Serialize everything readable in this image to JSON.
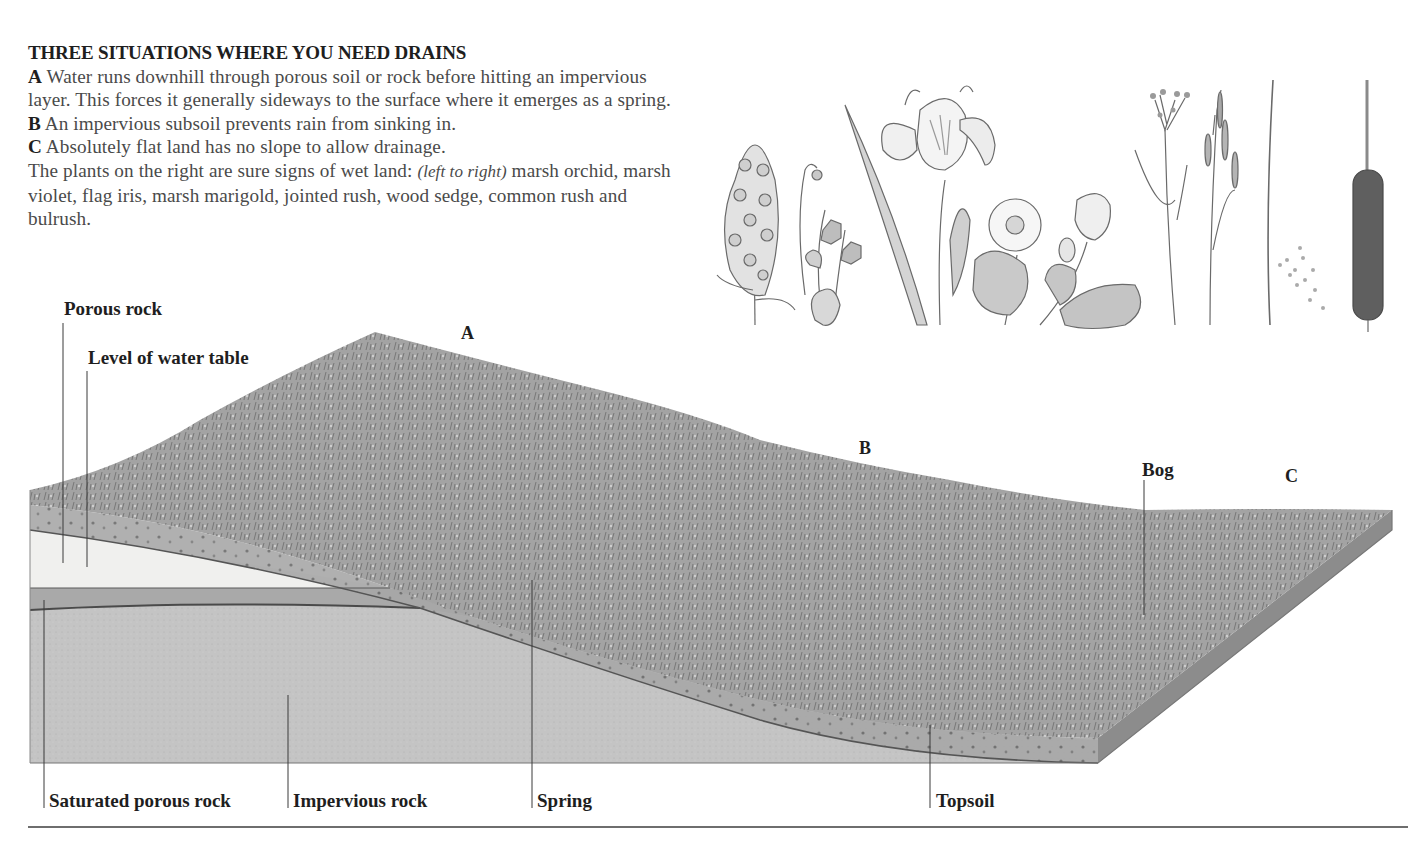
{
  "caption": {
    "heading": "THREE SITUATIONS WHERE YOU NEED DRAINS",
    "items": [
      {
        "key": "A",
        "text": "Water runs downhill through porous soil or rock before hitting an impervious layer. This forces it generally sideways to the surface where it emerges as a spring."
      },
      {
        "key": "B",
        "text": "An impervious subsoil prevents rain from sinking in."
      },
      {
        "key": "C",
        "text": "Absolutely flat land has no slope to allow drainage."
      }
    ],
    "plants_note": {
      "before": "The plants on the right are sure signs of wet land: ",
      "italic": "(left to right)",
      "after": " marsh orchid, marsh violet, flag iris, marsh marigold, jointed rush, wood sedge, common rush and bulrush."
    }
  },
  "plants": [
    {
      "name": "marsh orchid",
      "icon": "marsh-orchid-illustration"
    },
    {
      "name": "marsh violet",
      "icon": "marsh-violet-illustration"
    },
    {
      "name": "flag iris",
      "icon": "flag-iris-illustration"
    },
    {
      "name": "marsh marigold",
      "icon": "marsh-marigold-illustration"
    },
    {
      "name": "jointed rush",
      "icon": "jointed-rush-illustration"
    },
    {
      "name": "wood sedge",
      "icon": "wood-sedge-illustration"
    },
    {
      "name": "common rush",
      "icon": "common-rush-illustration"
    },
    {
      "name": "bulrush",
      "icon": "bulrush-illustration"
    }
  ],
  "diagram": {
    "situation_letters": {
      "a": "A",
      "b": "B",
      "c": "C"
    },
    "labels": {
      "porous_rock": "Porous rock",
      "water_table": "Level of water table",
      "bog": "Bog",
      "saturated_porous_rock": "Saturated porous rock",
      "impervious_rock": "Impervious rock",
      "spring": "Spring",
      "topsoil": "Topsoil"
    },
    "colors": {
      "vegetation": "#9a9a9a",
      "vegetation_dark": "#6f6f6f",
      "porous_rock": "#f0f0ee",
      "saturated_rock": "#a9a9a9",
      "impervious_rock": "#c4c4c4",
      "topsoil": "#a2a2a2",
      "leader_line": "#3a3a3a"
    }
  }
}
